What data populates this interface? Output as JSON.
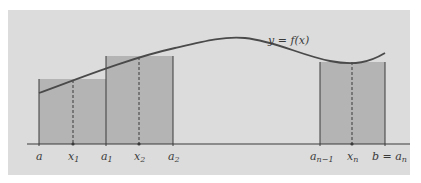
{
  "figure": {
    "colors": {
      "panel_bg": "#dcdcdc",
      "rect_fill": "#b4b4b4",
      "curve": "#4a4a4a",
      "lines": "#3a3a3a"
    },
    "curve_label": "y = f(x)",
    "axis_labels": [
      {
        "id": "a",
        "text": "a",
        "sub": ""
      },
      {
        "id": "x1",
        "text": "x",
        "sub": "1"
      },
      {
        "id": "a1",
        "text": "a",
        "sub": "1"
      },
      {
        "id": "x2",
        "text": "x",
        "sub": "2"
      },
      {
        "id": "a2",
        "text": "a",
        "sub": "2"
      },
      {
        "id": "an-1",
        "text": "a",
        "sub": "n−1"
      },
      {
        "id": "xn",
        "text": "x",
        "sub": "n"
      },
      {
        "id": "b",
        "text": "b = a",
        "sub": "n"
      }
    ],
    "rectangles": [
      {
        "from": "a",
        "to": "a1",
        "sample": "x1"
      },
      {
        "from": "a1",
        "to": "a2",
        "sample": "x2"
      },
      {
        "from": "an-1",
        "to": "b",
        "sample": "xn"
      }
    ]
  }
}
